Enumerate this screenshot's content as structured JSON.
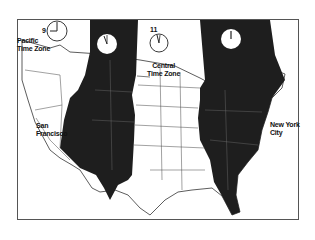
{
  "map": {
    "title": "",
    "zones": [
      {
        "name": "Pacific Time Zone",
        "label_line1": "Pacific",
        "label_line2": "Time Zone",
        "hour": "9",
        "shaded": false
      },
      {
        "name": "Mountain Time Zone",
        "hour": "10",
        "shaded": true
      },
      {
        "name": "Central Time Zone",
        "label_line1": "Central",
        "label_line2": "Time Zone",
        "hour": "11",
        "shaded": false
      },
      {
        "name": "Eastern Time Zone",
        "hour": "12",
        "shaded": true
      }
    ],
    "cities": [
      {
        "line1": "San",
        "line2": "Francisco"
      },
      {
        "line1": "New York",
        "line2": "City"
      }
    ],
    "colors": {
      "shaded": "#1e1e1e",
      "land": "#ffffff",
      "border": "#333333"
    }
  }
}
